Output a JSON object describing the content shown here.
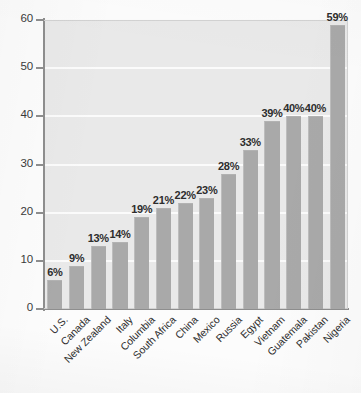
{
  "chart_data": {
    "type": "bar",
    "title": "",
    "subtitle": "",
    "xlabel": "",
    "ylabel": "",
    "ylim": [
      0,
      60
    ],
    "yticks": [
      0,
      10,
      20,
      30,
      40,
      50,
      60
    ],
    "ytick_labels": [
      "0",
      "10",
      "20",
      "30",
      "40",
      "50",
      "60"
    ],
    "grid": "horizontal",
    "legend": "none",
    "value_label_suffix": "%",
    "categories": [
      "U.S.",
      "Canada",
      "New Zealand",
      "Italy",
      "Columbia",
      "South Africa",
      "China",
      "Mexico",
      "Russia",
      "Egypt",
      "Vietnam",
      "Guatemala",
      "Pakistan",
      "Nigeria"
    ],
    "values": [
      6,
      9,
      13,
      14,
      19,
      21,
      22,
      23,
      28,
      33,
      39,
      40,
      40,
      59
    ],
    "value_labels": [
      "6%",
      "9%",
      "13%",
      "14%",
      "19%",
      "21%",
      "22%",
      "23%",
      "28%",
      "33%",
      "39%",
      "40%",
      "40%",
      "59%"
    ],
    "colors": {
      "bar": "#a9a9a9",
      "plot_background": "#e9e9e9",
      "gridline": "#fbfbfb",
      "axis": "#8e8e8e",
      "text": "#2d2d2d",
      "page_background": "#fcfcfc"
    }
  }
}
